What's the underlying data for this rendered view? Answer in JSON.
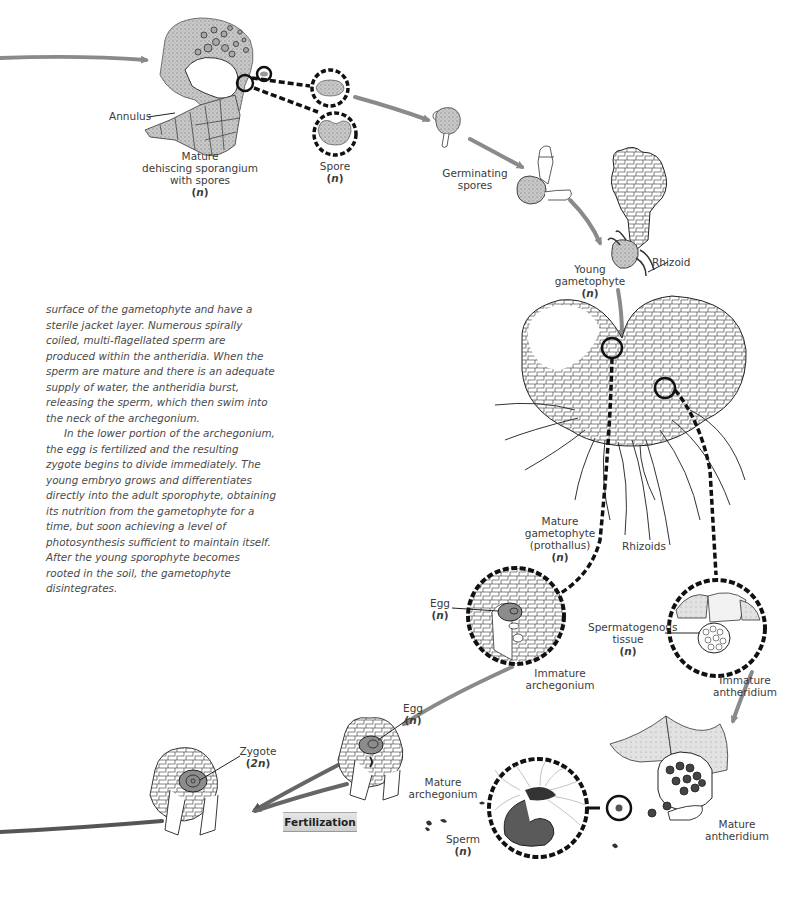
{
  "diagram": {
    "type": "fern-life-cycle-gametophyte-phase",
    "colors": {
      "arrow": "#8a8a8a",
      "outline": "#1a1a1a",
      "stipple": "#b9b9b9",
      "egg_fill": "#8c8c8c",
      "fertilization_box": "#d9d9d9"
    },
    "labels": {
      "annulus": "Annulus",
      "sporangium": [
        "Mature",
        "dehiscing sporangium",
        "with spores"
      ],
      "sporangium_ploidy": "n",
      "spore": "Spore",
      "spore_ploidy": "n",
      "germinating_spores": [
        "Germinating",
        "spores"
      ],
      "rhizoid": "Rhizoid",
      "young_gametophyte": [
        "Young",
        "gametophyte"
      ],
      "young_gametophyte_ploidy": "n",
      "mature_gametophyte": [
        "Mature",
        "gametophyte",
        "(prothallus)"
      ],
      "mature_gametophyte_ploidy": "n",
      "rhizoids": "Rhizoids",
      "egg_immature": "Egg",
      "egg_immature_ploidy": "n",
      "immature_archegonium": [
        "Immature",
        "archegonium"
      ],
      "spermatogenous_tissue": [
        "Spermatogenous",
        "tissue"
      ],
      "spermatogenous_ploidy": "n",
      "immature_antheridium": [
        "Immature",
        "antheridium"
      ],
      "egg_mature": "Egg",
      "egg_mature_ploidy": "n",
      "mature_archegonium": [
        "Mature",
        "archegonium"
      ],
      "zygote": "Zygote",
      "zygote_ploidy": "2n",
      "fertilization": "Fertilization",
      "sperm": "Sperm",
      "sperm_ploidy": "n",
      "mature_antheridium": [
        "Mature",
        "antheridium"
      ]
    }
  },
  "text": {
    "paragraph1": "surface of the gametophyte and have a sterile jacket layer. Numerous spirally coiled, multi-flagellated sperm are produced within the antheridia. When the sperm are mature and there is an adequate supply of water, the antheridia burst, releasing the sperm, which then swim into the neck of the archegonium.",
    "paragraph2": "In the lower portion of the archegonium, the egg is fertilized and the resulting zygote begins to divide immediately. The young embryo grows and differentiates directly into the adult sporophyte, obtaining its nutrition from the gametophyte for a time, but soon achieving a level of photosynthesis sufficient to maintain itself. After the young sporophyte becomes rooted in the soil, the gametophyte disintegrates."
  }
}
